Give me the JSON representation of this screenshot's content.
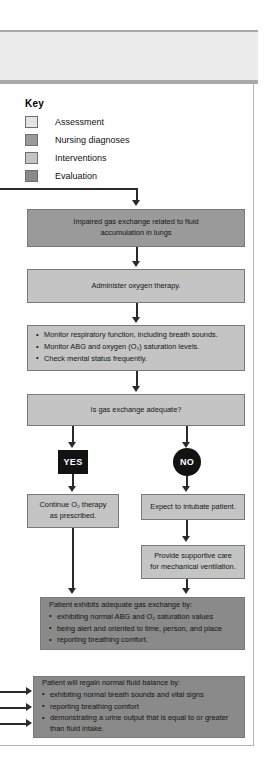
{
  "key": {
    "title": "Key",
    "items": [
      {
        "label": "Assessment",
        "color": "#e4e4e4"
      },
      {
        "label": "Nursing diagnoses",
        "color": "#9a9a9a"
      },
      {
        "label": "Interventions",
        "color": "#c4c4c4"
      },
      {
        "label": "Evaluation",
        "color": "#8a8a8a"
      }
    ]
  },
  "flow": {
    "diagnosis_box": {
      "line1": "Impaired gas exchange related to fluid",
      "line2": "accumulation in lungs"
    },
    "intervention_box": {
      "text": "Administer oxygen therapy."
    },
    "monitoring_box": {
      "bullets": [
        "Monitor respiratory function, including breath sounds.",
        "Monitor ABG and oxygen (O₂) saturation levels.",
        "Check mental status frequently."
      ]
    },
    "decision_box": {
      "text": "Is gas exchange adequate?"
    },
    "yes_label": "YES",
    "no_label": "NO",
    "continue_box": {
      "line1": "Continue O₂ therapy",
      "line2": "as prescribed."
    },
    "intubate_box": {
      "text": "Expect to intubate patient."
    },
    "supportive_box": {
      "line1": "Provide supportive care",
      "line2": "for mechanical ventilation."
    },
    "evaluation_box": {
      "lead": "Patient exhibits adequate gas exchange by:",
      "bullets": [
        "exhibiting normal ABG and O₂ saturation values",
        "being alert and oriented to time, person, and place",
        "reporting breathing comfort."
      ]
    },
    "outcome_box": {
      "lead": "Patient will regain normal fluid balance by:",
      "bullets": [
        "exhibiting normal breath sounds and vital signs",
        "reporting breathing comfort",
        "demonstrating a urine output that is equal to or greater than fluid intake."
      ]
    }
  },
  "colors": {
    "assessment": "#e4e4e4",
    "nursing_diagnoses": "#9a9a9a",
    "interventions": "#c4c4c4",
    "evaluation": "#8a8a8a",
    "connector": "#2b2b2b",
    "badge": "#121212"
  }
}
